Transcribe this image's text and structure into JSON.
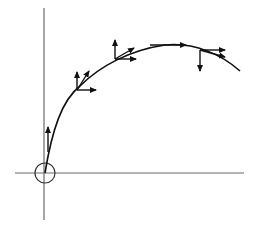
{
  "diagram": {
    "title": "",
    "colors": {
      "axis": "#6a6a6a",
      "curve": "#111111",
      "vector": "#111111",
      "background": "#ffffff"
    },
    "axes": {
      "vertical": {
        "x": 44,
        "y1": 8,
        "y2": 220
      },
      "horizontal": {
        "y": 173,
        "x1": 15,
        "x2": 244
      }
    },
    "origin_marker": {
      "cx": 45,
      "cy": 173,
      "r": 10
    },
    "trajectory_path": "M45,173 C52,130 62,100 80,86 C100,66 130,50 165,45 C195,42 222,55 240,71",
    "points": [
      {
        "name": "point-1",
        "x": 48,
        "y": 152,
        "vectors": [
          {
            "kind": "vertical",
            "x2": 48,
            "y2": 127
          }
        ]
      },
      {
        "name": "point-2",
        "x": 77,
        "y": 90,
        "vectors": [
          {
            "kind": "vertical",
            "x2": 77,
            "y2": 72
          },
          {
            "kind": "horizontal",
            "x2": 96,
            "y2": 90
          },
          {
            "kind": "tangent",
            "x2": 89,
            "y2": 71
          }
        ]
      },
      {
        "name": "point-3",
        "x": 115,
        "y": 59,
        "vectors": [
          {
            "kind": "vertical",
            "x2": 115,
            "y2": 40
          },
          {
            "kind": "horizontal",
            "x2": 136,
            "y2": 59
          },
          {
            "kind": "tangent",
            "x2": 134,
            "y2": 48
          }
        ]
      },
      {
        "name": "point-4",
        "x": 150,
        "y": 45,
        "vectors": [
          {
            "kind": "horizontal",
            "x2": 186,
            "y2": 45
          }
        ]
      },
      {
        "name": "point-5",
        "x": 200,
        "y": 50,
        "vectors": [
          {
            "kind": "vertical-down",
            "x2": 200,
            "y2": 71
          },
          {
            "kind": "horizontal",
            "x2": 225,
            "y2": 50
          },
          {
            "kind": "tangent",
            "x2": 225,
            "y2": 57
          }
        ]
      }
    ]
  }
}
